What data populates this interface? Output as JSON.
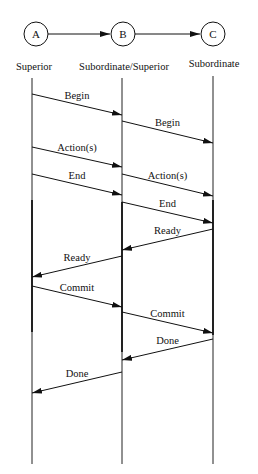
{
  "nodes": [
    {
      "id": "A",
      "label": "A",
      "x": 36,
      "y": 34
    },
    {
      "id": "B",
      "label": "B",
      "x": 123,
      "y": 34
    },
    {
      "id": "C",
      "label": "C",
      "x": 213,
      "y": 34
    }
  ],
  "roles": [
    {
      "label": "Superior",
      "x": 34,
      "y": 70
    },
    {
      "label": "Subordinate/Superior",
      "x": 124,
      "y": 70
    },
    {
      "label": "Subordinate",
      "x": 214,
      "y": 67
    }
  ],
  "lifelines": [
    32,
    122,
    213
  ],
  "messages": [
    {
      "label": "Begin",
      "from": 0,
      "to": 1,
      "y1": 94,
      "y2": 115
    },
    {
      "label": "Begin",
      "from": 1,
      "to": 2,
      "y1": 121,
      "y2": 143
    },
    {
      "label": "Action(s)",
      "from": 0,
      "to": 1,
      "y1": 147,
      "y2": 167
    },
    {
      "label": "End",
      "from": 0,
      "to": 1,
      "y1": 174,
      "y2": 195
    },
    {
      "label": "Action(s)",
      "from": 1,
      "to": 2,
      "y1": 174,
      "y2": 196
    },
    {
      "label": "End",
      "from": 1,
      "to": 2,
      "y1": 202,
      "y2": 223
    },
    {
      "label": "Ready",
      "from": 2,
      "to": 1,
      "y1": 229,
      "y2": 250
    },
    {
      "label": "Ready",
      "from": 1,
      "to": 0,
      "y1": 256,
      "y2": 277
    },
    {
      "label": "Commit",
      "from": 0,
      "to": 1,
      "y1": 286,
      "y2": 307
    },
    {
      "label": "Commit",
      "from": 1,
      "to": 2,
      "y1": 312,
      "y2": 333
    },
    {
      "label": "Done",
      "from": 2,
      "to": 1,
      "y1": 339,
      "y2": 360
    },
    {
      "label": "Done",
      "from": 1,
      "to": 0,
      "y1": 372,
      "y2": 393
    }
  ]
}
